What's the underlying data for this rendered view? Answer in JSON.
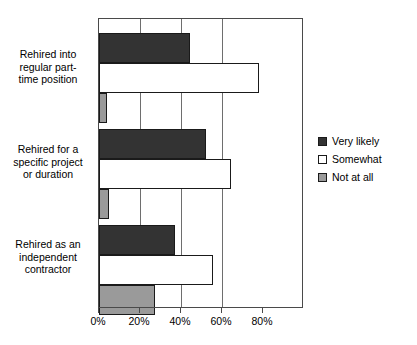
{
  "chart_data": {
    "type": "bar",
    "orientation": "horizontal",
    "title": "",
    "xlabel": "",
    "ylabel": "",
    "xlim": [
      0,
      80
    ],
    "xticks": [
      "0%",
      "20%",
      "40%",
      "60%",
      "80%"
    ],
    "xtick_values": [
      0,
      20,
      40,
      60,
      80
    ],
    "grid": true,
    "legend_position": "right",
    "categories": [
      "Rehired into\nregular part-\ntime position",
      "Rehired for a\nspecific project\nor duration",
      "Rehired as an\nindependent\ncontractor"
    ],
    "series": [
      {
        "name": "Very likely",
        "color": "#333333",
        "values": [
          36,
          42,
          30
        ]
      },
      {
        "name": "Somewhat",
        "color": "#ffffff",
        "values": [
          63,
          52,
          45
        ]
      },
      {
        "name": "Not at all",
        "color": "#9a9a9a",
        "values": [
          3,
          4,
          22
        ]
      }
    ]
  },
  "legend": {
    "items": [
      {
        "label": "Very likely"
      },
      {
        "label": "Somewhat"
      },
      {
        "label": "Not at all"
      }
    ]
  }
}
